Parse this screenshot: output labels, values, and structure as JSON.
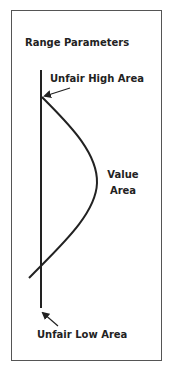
{
  "diagram": {
    "title": "Range Parameters",
    "labels": {
      "unfair_high": "Unfair High Area",
      "value_line1": "Value",
      "value_line2": "Area",
      "unfair_low": "Unfair Low Area"
    },
    "colors": {
      "line": "#222222",
      "frame": "#555555",
      "background": "#ffffff"
    }
  }
}
